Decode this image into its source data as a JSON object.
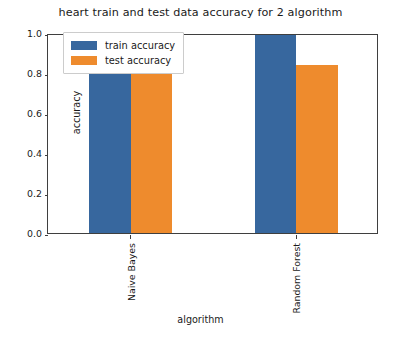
{
  "chart_data": {
    "type": "bar",
    "title": "heart train and test data accuracy for 2 algorithm",
    "xlabel": "algorithm",
    "ylabel": "accuracy",
    "categories": [
      "Naive Bayes",
      "Random Forest"
    ],
    "series": [
      {
        "name": "train accuracy",
        "values": [
          0.83,
          0.99
        ],
        "color": "#37679e"
      },
      {
        "name": "test accuracy",
        "values": [
          0.825,
          0.84
        ],
        "color": "#ee8b2d"
      }
    ],
    "ylim": [
      0.0,
      1.0
    ],
    "yticks": [
      "0.0",
      "0.2",
      "0.4",
      "0.6",
      "0.8",
      "1.0"
    ],
    "ytick_values": [
      0.0,
      0.2,
      0.4,
      0.6,
      0.8,
      1.0
    ],
    "grid": false,
    "legend_position": "upper left",
    "legend_entries": [
      "train accuracy",
      "test accuracy"
    ],
    "annotations": []
  }
}
